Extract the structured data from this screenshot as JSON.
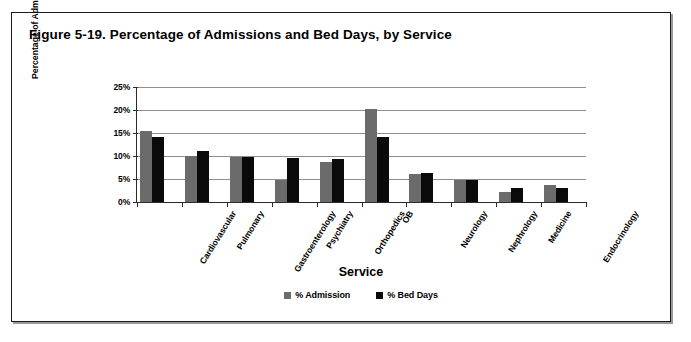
{
  "figure": {
    "title": "Figure 5-19. Percentage of Admissions and Bed Days, by Service"
  },
  "chart_data": {
    "type": "bar",
    "title": "Figure 5-19. Percentage of Admissions and Bed Days, by Service",
    "xlabel": "Service",
    "ylabel": "Percentage of Admissions or Bed Days",
    "ylim": [
      0,
      25
    ],
    "ytick_labels": [
      "0%",
      "5%",
      "10%",
      "15%",
      "20%",
      "25%"
    ],
    "ytick_values": [
      0,
      5,
      10,
      15,
      20,
      25
    ],
    "grid": true,
    "legend_position": "bottom",
    "categories": [
      "Cardiovascular",
      "Pulmonary",
      "Gastroenterology",
      "Psychiatry",
      "Orthopedics",
      "OB",
      "Neurology",
      "Nephrology",
      "Medicine",
      "Endocrinology"
    ],
    "series": [
      {
        "name": "% Admission",
        "color": "#6b6b6b",
        "values": [
          15.5,
          10.0,
          9.7,
          4.8,
          8.8,
          20.3,
          6.0,
          4.7,
          2.2,
          3.6
        ]
      },
      {
        "name": "% Bed Days",
        "color": "#0a0a0a",
        "values": [
          14.2,
          11.0,
          9.7,
          9.5,
          9.3,
          14.2,
          6.4,
          4.7,
          3.0,
          3.0
        ]
      }
    ]
  }
}
